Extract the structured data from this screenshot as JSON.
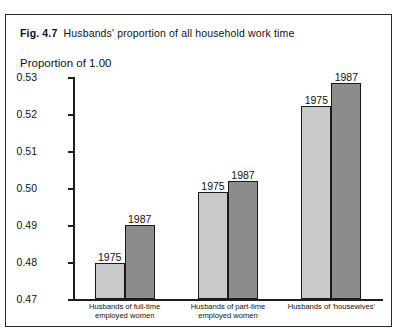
{
  "figure": {
    "fig_number": "Fig. 4.7",
    "title": "Husbands' proportion of all household work time",
    "axis_label": "Proportion of 1.00"
  },
  "chart_data": {
    "type": "bar",
    "xlabel": "",
    "ylabel": "Proportion of 1.00",
    "ylim": [
      0.47,
      0.53
    ],
    "ytick_step": 0.01,
    "yticks": [
      "0.53",
      "0.52",
      "0.51",
      "0.50",
      "0.49",
      "0.48",
      "0.47"
    ],
    "ytick_values": [
      0.53,
      0.52,
      0.51,
      0.5,
      0.49,
      0.48,
      0.47
    ],
    "grid": false,
    "legend": "none",
    "bar_value_labels": true,
    "categories": [
      "Husbands of full-time employed women",
      "Husbands of part-time employed women",
      "Husbands of 'housewives'"
    ],
    "category_lines": [
      [
        "Husbands of full-time",
        "employed women"
      ],
      [
        "Husbands of part-time",
        "employed women"
      ],
      [
        "Husbands of 'housewives'"
      ]
    ],
    "series": [
      {
        "name": "1975",
        "color": "#c9c9c9",
        "values": [
          0.4798,
          0.499,
          0.5222
        ]
      },
      {
        "name": "1987",
        "color": "#8c8c8c",
        "values": [
          0.49,
          0.502,
          0.5285
        ]
      }
    ]
  }
}
